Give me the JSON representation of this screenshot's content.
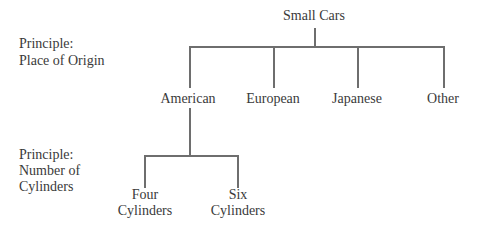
{
  "root": {
    "label": "Small Cars"
  },
  "principles": [
    {
      "line1": "Principle:",
      "line2": "Place of Origin"
    },
    {
      "line1": "Principle:",
      "line2": "Number of",
      "line3": "Cylinders"
    }
  ],
  "level1": [
    {
      "label": "American"
    },
    {
      "label": "European"
    },
    {
      "label": "Japanese"
    },
    {
      "label": "Other"
    }
  ],
  "level2": [
    {
      "line1": "Four",
      "line2": "Cylinders"
    },
    {
      "line1": "Six",
      "line2": "Cylinders"
    }
  ]
}
